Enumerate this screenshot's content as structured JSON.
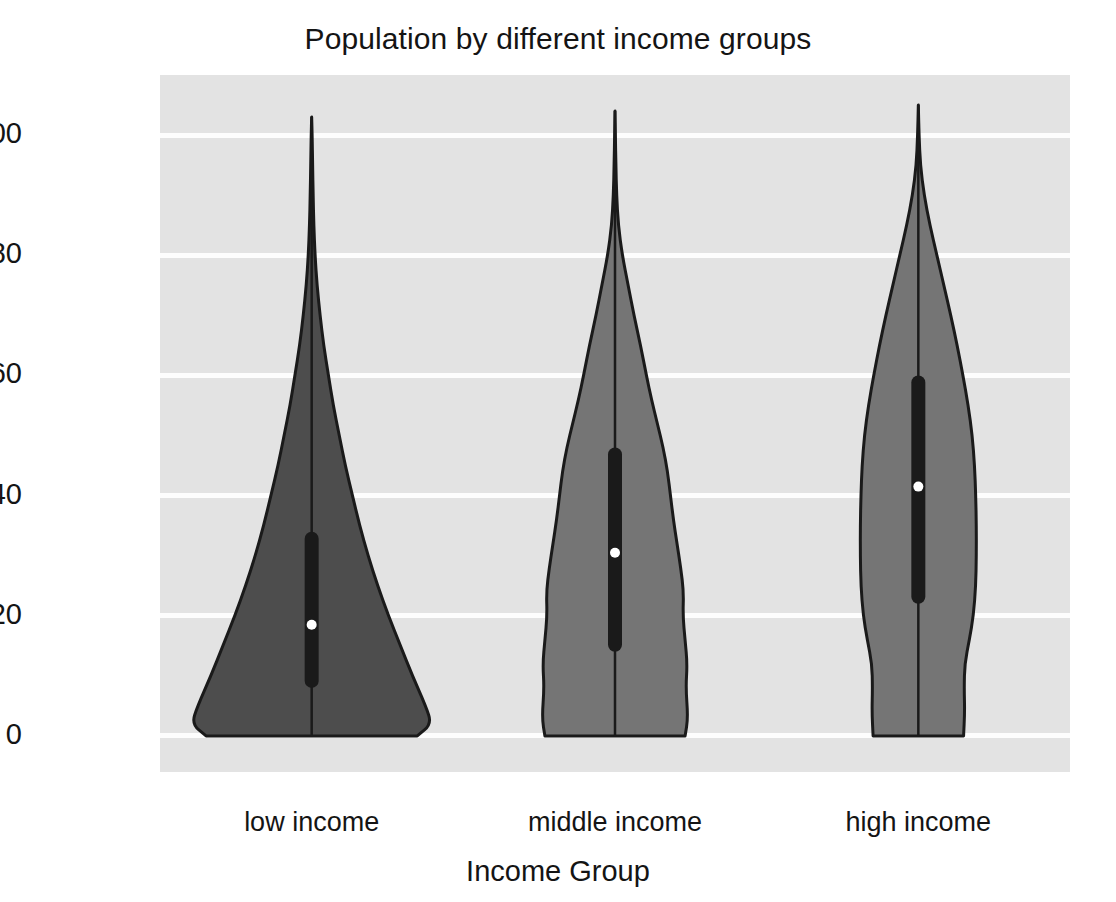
{
  "chart_data": {
    "type": "violin",
    "title": "Population by different income groups",
    "xlabel": "Income Group",
    "ylabel": "Age",
    "categories": [
      "low income",
      "middle income",
      "high income"
    ],
    "ylim": [
      -6,
      110
    ],
    "yticks": [
      0,
      20,
      40,
      60,
      80,
      100
    ],
    "ytick_labels": [
      "0",
      "20",
      "40",
      "60",
      "80",
      "100"
    ],
    "grid": true,
    "legend": "none",
    "series": [
      {
        "name": "low income",
        "color": "#4d4d4d",
        "edge_color": "#1a1a1a",
        "min": 0,
        "max": 103,
        "q1": 8,
        "median": 18.5,
        "q3": 34,
        "whisker_low": 0,
        "whisker_high": 103,
        "max_half_width": 120,
        "density": [
          {
            "age": 0,
            "w": 0.88
          },
          {
            "age": 2,
            "w": 1.0
          },
          {
            "age": 5,
            "w": 0.95
          },
          {
            "age": 10,
            "w": 0.84
          },
          {
            "age": 15,
            "w": 0.74
          },
          {
            "age": 20,
            "w": 0.64
          },
          {
            "age": 25,
            "w": 0.55
          },
          {
            "age": 30,
            "w": 0.47
          },
          {
            "age": 35,
            "w": 0.4
          },
          {
            "age": 40,
            "w": 0.34
          },
          {
            "age": 45,
            "w": 0.28
          },
          {
            "age": 50,
            "w": 0.23
          },
          {
            "age": 55,
            "w": 0.18
          },
          {
            "age": 60,
            "w": 0.14
          },
          {
            "age": 65,
            "w": 0.1
          },
          {
            "age": 70,
            "w": 0.07
          },
          {
            "age": 75,
            "w": 0.045
          },
          {
            "age": 80,
            "w": 0.028
          },
          {
            "age": 85,
            "w": 0.018
          },
          {
            "age": 90,
            "w": 0.012
          },
          {
            "age": 95,
            "w": 0.008
          },
          {
            "age": 100,
            "w": 0.004
          },
          {
            "age": 103,
            "w": 0.0
          }
        ]
      },
      {
        "name": "middle income",
        "color": "#757575",
        "edge_color": "#1a1a1a",
        "min": 0,
        "max": 104,
        "q1": 14,
        "median": 30.5,
        "q3": 48,
        "whisker_low": 0,
        "whisker_high": 104,
        "max_half_width": 73,
        "density": [
          {
            "age": 0,
            "w": 0.96
          },
          {
            "age": 3,
            "w": 1.0
          },
          {
            "age": 8,
            "w": 0.97
          },
          {
            "age": 12,
            "w": 0.99
          },
          {
            "age": 16,
            "w": 0.96
          },
          {
            "age": 20,
            "w": 0.93
          },
          {
            "age": 24,
            "w": 0.94
          },
          {
            "age": 28,
            "w": 0.9
          },
          {
            "age": 32,
            "w": 0.85
          },
          {
            "age": 36,
            "w": 0.8
          },
          {
            "age": 40,
            "w": 0.76
          },
          {
            "age": 44,
            "w": 0.72
          },
          {
            "age": 48,
            "w": 0.66
          },
          {
            "age": 52,
            "w": 0.58
          },
          {
            "age": 56,
            "w": 0.5
          },
          {
            "age": 60,
            "w": 0.43
          },
          {
            "age": 65,
            "w": 0.35
          },
          {
            "age": 70,
            "w": 0.26
          },
          {
            "age": 75,
            "w": 0.18
          },
          {
            "age": 80,
            "w": 0.1
          },
          {
            "age": 85,
            "w": 0.045
          },
          {
            "age": 90,
            "w": 0.022
          },
          {
            "age": 95,
            "w": 0.012
          },
          {
            "age": 100,
            "w": 0.005
          },
          {
            "age": 104,
            "w": 0.0
          }
        ]
      },
      {
        "name": "high income",
        "color": "#757575",
        "edge_color": "#1a1a1a",
        "min": 0,
        "max": 105,
        "q1": 22,
        "median": 41.5,
        "q3": 60,
        "whisker_low": 0,
        "whisker_high": 105,
        "max_half_width": 58,
        "density": [
          {
            "age": 0,
            "w": 0.78
          },
          {
            "age": 4,
            "w": 0.8
          },
          {
            "age": 8,
            "w": 0.79
          },
          {
            "age": 12,
            "w": 0.8
          },
          {
            "age": 16,
            "w": 0.88
          },
          {
            "age": 20,
            "w": 0.95
          },
          {
            "age": 25,
            "w": 0.99
          },
          {
            "age": 30,
            "w": 1.0
          },
          {
            "age": 35,
            "w": 1.0
          },
          {
            "age": 40,
            "w": 0.99
          },
          {
            "age": 45,
            "w": 0.97
          },
          {
            "age": 50,
            "w": 0.93
          },
          {
            "age": 55,
            "w": 0.86
          },
          {
            "age": 60,
            "w": 0.77
          },
          {
            "age": 65,
            "w": 0.67
          },
          {
            "age": 70,
            "w": 0.56
          },
          {
            "age": 75,
            "w": 0.44
          },
          {
            "age": 80,
            "w": 0.32
          },
          {
            "age": 85,
            "w": 0.2
          },
          {
            "age": 90,
            "w": 0.1
          },
          {
            "age": 95,
            "w": 0.035
          },
          {
            "age": 100,
            "w": 0.012
          },
          {
            "age": 105,
            "w": 0.0
          }
        ]
      }
    ]
  },
  "style": {
    "plot_background": "#e3e3e3",
    "gridline_color": "#fdfdfd",
    "figure_background": "#ffffff",
    "text_color": "#141414"
  }
}
